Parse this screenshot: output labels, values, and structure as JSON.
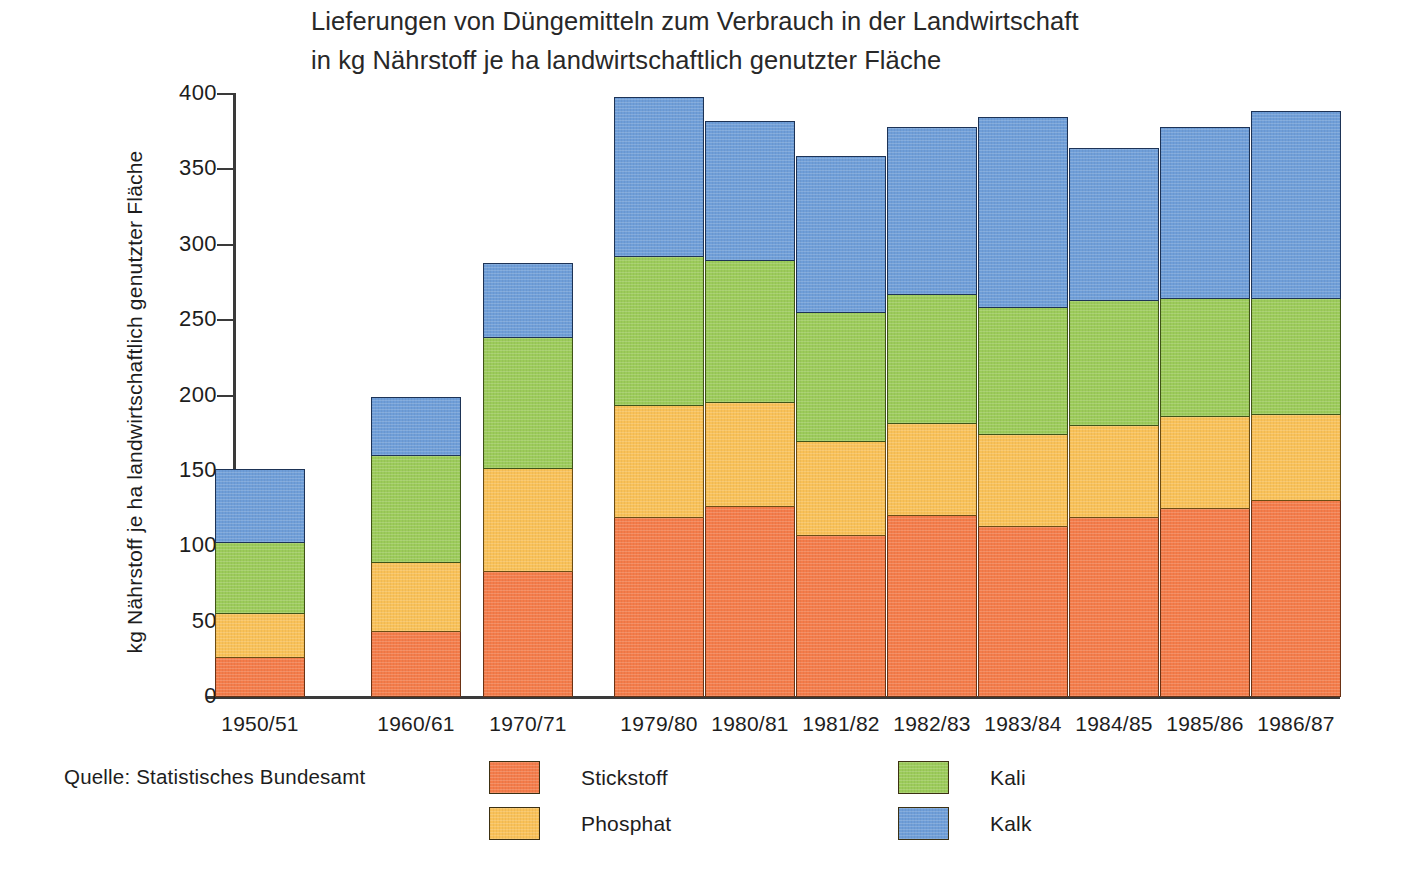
{
  "title": {
    "line1": "Lieferungen von Düngemitteln zum Verbrauch in der Landwirtschaft",
    "line2": "in kg Nährstoff je ha landwirtschaftlich genutzter Fläche"
  },
  "source": {
    "label": "Quelle:  Statistisches Bundesamt"
  },
  "legend": [
    {
      "key": "stickstoff",
      "label": "Stickstoff",
      "color": "#f47c4a"
    },
    {
      "key": "phosphat",
      "label": "Phosphat",
      "color": "#f9c158"
    },
    {
      "key": "kali",
      "label": "Kali",
      "color": "#9ccb5a"
    },
    {
      "key": "kalk",
      "label": "Kalk",
      "color": "#6f9ed8"
    }
  ],
  "chart_data": {
    "type": "bar",
    "stacked": true,
    "title": "Lieferungen von Düngemitteln zum Verbrauch in der Landwirtschaft in kg Nährstoff je ha landwirtschaftlich genutzter Fläche",
    "xlabel": "",
    "ylabel": "kg Nährstoff je ha landwirtschaftlich genutzter Fläche",
    "ylim": [
      0,
      400
    ],
    "yticks": [
      0,
      50,
      100,
      150,
      200,
      250,
      300,
      350,
      400
    ],
    "grid": false,
    "legend_position": "bottom",
    "categories": [
      "1950/51",
      "1960/61",
      "1970/71",
      "1979/80",
      "1980/81",
      "1981/82",
      "1982/83",
      "1983/84",
      "1984/85",
      "1985/86",
      "1986/87"
    ],
    "series": [
      {
        "name": "Stickstoff",
        "color": "#f47c4a",
        "values": [
          26,
          43,
          83,
          119,
          126,
          107,
          120,
          113,
          119,
          125,
          130
        ]
      },
      {
        "name": "Phosphat",
        "color": "#f9c158",
        "values": [
          29,
          46,
          68,
          74,
          69,
          62,
          61,
          61,
          61,
          61,
          57
        ]
      },
      {
        "name": "Kali",
        "color": "#9ccb5a",
        "values": [
          47,
          71,
          87,
          99,
          94,
          86,
          86,
          84,
          83,
          78,
          77
        ]
      },
      {
        "name": "Kalk",
        "color": "#6f9ed8",
        "values": [
          48,
          38,
          49,
          105,
          92,
          103,
          110,
          126,
          100,
          113,
          124
        ]
      }
    ],
    "totals": [
      150,
      198,
      287,
      397,
      381,
      358,
      377,
      384,
      363,
      377,
      388
    ]
  },
  "geometry": {
    "baseline_y": 697,
    "top_y": 94,
    "px_per_unit": 1.5075,
    "bar_width": 90,
    "bar_lefts": [
      215,
      371,
      483,
      614,
      705,
      796,
      887,
      978,
      1069,
      1160,
      1251
    ]
  }
}
